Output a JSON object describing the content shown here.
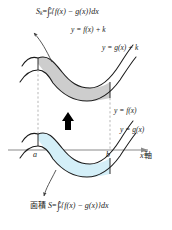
{
  "figure": {
    "title_formula": {
      "lhs": "S",
      "lhs_sub": "k",
      "eq": "=",
      "integral": "∫",
      "lower": "a",
      "upper": "b",
      "body": "{f(x) − g(x)}dx",
      "full_text": "S_k = ∫_a^b {f(x) − g(x)}dx"
    },
    "bottom_formula": {
      "prefix": "面積",
      "lhs": "S",
      "eq": "=",
      "integral": "∫",
      "lower": "a",
      "upper": "b",
      "body": "{f(x) − g(x)}dx",
      "full_text": "面積 S = ∫_a^b {f(x) − g(x)}dx"
    },
    "curve_labels": [
      {
        "id": "f-plus-k",
        "text": "y = f(x) + k"
      },
      {
        "id": "g-plus-k",
        "text": "y = g(x) + k"
      },
      {
        "id": "f",
        "text": "y = f(x)"
      },
      {
        "id": "g",
        "text": "y = g(x)"
      }
    ],
    "axis": {
      "x_axis_label": "x 軸",
      "x_axis_label_italic_part": "x",
      "x_axis_label_jp_part": "軸",
      "tick_labels": [
        "a",
        "b"
      ]
    },
    "regions": [
      {
        "id": "upper-region",
        "fill": "#c9c9c9",
        "description": "shaded area between y=f(x)+k and y=g(x)+k"
      },
      {
        "id": "lower-region",
        "fill": "#d4eff8",
        "description": "shaded area between y=f(x) and y=g(x)"
      }
    ],
    "arrows": [
      {
        "id": "translate-arrow",
        "direction": "up",
        "color": "#000000"
      },
      {
        "id": "upper-leader-arrow",
        "direction": "up-left"
      },
      {
        "id": "lower-leader-arrow",
        "direction": "down"
      }
    ],
    "colors": {
      "curve_stroke": "#1a1a1a",
      "axis_stroke": "#7d7d7d",
      "dash_stroke": "#9a9a9a",
      "upper_fill": "#c9c9c9",
      "lower_fill": "#d4eff8",
      "text": "#1a1a1a",
      "background": "#ffffff"
    }
  }
}
